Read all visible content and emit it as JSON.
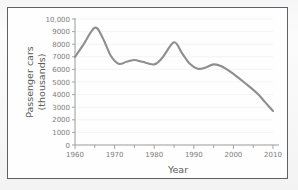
{
  "figure": {
    "border_color": "#5d6064",
    "background_color": "#fefefe"
  },
  "chart_data": {
    "type": "line",
    "title": "",
    "xlabel": "Year",
    "ylabel": "Passenger cars (thousands)",
    "ylabel_line1": "Passenger cars",
    "ylabel_line2": "(thousands)",
    "xlim": [
      1960,
      2010
    ],
    "ylim": [
      0,
      10000
    ],
    "grid": true,
    "legend": "none",
    "line_color": "#8e8e8e",
    "x_tick_labels": [
      "1960",
      "1970",
      "1980",
      "1990",
      "2000",
      "2010"
    ],
    "x_tick_values": [
      1960,
      1970,
      1980,
      1990,
      2000,
      2010
    ],
    "x_minor_tick_values": [
      1965,
      1975,
      1985,
      1995,
      2005
    ],
    "y_tick_labels": [
      "0",
      "1000",
      "2000",
      "3000",
      "4000",
      "5000",
      "6000",
      "7000",
      "8000",
      "9000",
      "10,000"
    ],
    "y_tick_values": [
      0,
      1000,
      2000,
      3000,
      4000,
      5000,
      6000,
      7000,
      8000,
      9000,
      10000
    ],
    "x": [
      1960,
      1962,
      1965,
      1967,
      1969,
      1971,
      1973,
      1975,
      1977,
      1980,
      1982,
      1985,
      1987,
      1989,
      1991,
      1993,
      1995,
      1997,
      2000,
      2003,
      2006,
      2008,
      2010
    ],
    "values": [
      7000,
      7900,
      9300,
      8500,
      7100,
      6450,
      6600,
      6750,
      6600,
      6400,
      6900,
      8150,
      7300,
      6450,
      6050,
      6150,
      6400,
      6250,
      5650,
      4900,
      4100,
      3400,
      2700
    ],
    "series": [
      {
        "name": "Passenger cars",
        "values": [
          7000,
          7900,
          9300,
          8500,
          7100,
          6450,
          6600,
          6750,
          6600,
          6400,
          6900,
          8150,
          7300,
          6450,
          6050,
          6150,
          6400,
          6250,
          5650,
          4900,
          4100,
          3400,
          2700
        ]
      }
    ]
  }
}
